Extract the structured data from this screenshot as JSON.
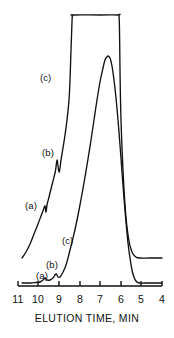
{
  "figure": {
    "title": "",
    "background_color": "#ffffff",
    "ink_color": "#111111",
    "width": 174,
    "height": 338
  },
  "axis": {
    "title": "ELUTION TIME, MIN",
    "tick_labels": [
      "11",
      "10",
      "9",
      "8",
      "7",
      "6",
      "5",
      "4"
    ],
    "tick_positions_px": [
      18,
      38,
      59,
      80,
      100,
      121,
      141,
      162
    ],
    "direction": "reversed",
    "x_pixel_start": 18,
    "x_pixel_end": 162,
    "baseline_y_px": 286
  },
  "curve_labels": [
    {
      "text": "(c)",
      "x": 40,
      "y": 73,
      "trace": "upper",
      "feature": "rising-edge"
    },
    {
      "text": "(b)",
      "x": 42,
      "y": 148,
      "trace": "upper",
      "feature": "minor-peak"
    },
    {
      "text": "(a)",
      "x": 25,
      "y": 201,
      "trace": "upper",
      "feature": "minor-peak"
    },
    {
      "text": "(c)",
      "x": 62,
      "y": 236,
      "trace": "lower",
      "feature": "rising-edge"
    },
    {
      "text": "(b)",
      "x": 46,
      "y": 260,
      "trace": "lower",
      "feature": "minor-peak"
    },
    {
      "text": "(a)",
      "x": 36,
      "y": 271,
      "trace": "lower",
      "feature": "minor-peak"
    }
  ],
  "chart_data": {
    "type": "line",
    "title": "",
    "subtitle": "",
    "xlabel": "ELUTION TIME, MIN",
    "ylabel": "",
    "xlim": [
      11,
      4
    ],
    "xticks": [
      11,
      10,
      9,
      8,
      7,
      6,
      5,
      4
    ],
    "grid": false,
    "legend": "inline-annotations",
    "annotations": [
      "(a)",
      "(b)",
      "(c)"
    ],
    "series": [
      {
        "name": "upper-trace",
        "description": "Offset upper chromatogram, saturated flat-topped main peak",
        "baseline_y_px": 258,
        "points_px": [
          [
            22,
            258
          ],
          [
            26,
            252
          ],
          [
            30,
            244
          ],
          [
            34,
            234
          ],
          [
            38,
            224
          ],
          [
            41,
            216
          ],
          [
            43,
            211
          ],
          [
            45,
            206
          ],
          [
            46,
            212
          ],
          [
            47,
            205
          ],
          [
            49,
            197
          ],
          [
            51,
            189
          ],
          [
            53,
            181
          ],
          [
            55,
            173
          ],
          [
            56,
            167
          ],
          [
            57,
            160
          ],
          [
            58,
            166
          ],
          [
            59,
            172
          ],
          [
            60,
            168
          ],
          [
            61,
            160
          ],
          [
            63,
            148
          ],
          [
            65,
            135
          ],
          [
            67,
            120
          ],
          [
            69,
            100
          ],
          [
            70,
            80
          ],
          [
            71,
            50
          ],
          [
            72,
            22
          ],
          [
            72.5,
            16
          ],
          [
            74,
            15
          ],
          [
            100,
            15
          ],
          [
            118,
            15
          ],
          [
            119,
            16
          ],
          [
            119.5,
            30
          ],
          [
            120,
            70
          ],
          [
            121,
            120
          ],
          [
            123,
            170
          ],
          [
            125,
            205
          ],
          [
            127,
            227
          ],
          [
            129,
            241
          ],
          [
            131,
            249
          ],
          [
            133,
            254
          ],
          [
            136,
            257
          ],
          [
            140,
            258
          ],
          [
            150,
            258
          ],
          [
            162,
            258
          ]
        ]
      },
      {
        "name": "lower-trace",
        "description": "Attenuated lower chromatogram with resolved (a), (b) and full (c) peak",
        "baseline_y_px": 283,
        "points_px": [
          [
            22,
            283
          ],
          [
            30,
            283
          ],
          [
            36,
            282.5
          ],
          [
            40,
            282
          ],
          [
            43,
            280
          ],
          [
            45,
            278
          ],
          [
            46,
            279
          ],
          [
            47,
            280
          ],
          [
            50,
            280
          ],
          [
            53,
            278
          ],
          [
            55,
            275
          ],
          [
            56,
            274
          ],
          [
            57,
            275
          ],
          [
            58,
            277
          ],
          [
            60,
            277
          ],
          [
            62,
            274
          ],
          [
            64,
            270
          ],
          [
            66,
            265
          ],
          [
            68,
            258
          ],
          [
            70,
            250
          ],
          [
            73,
            238
          ],
          [
            76,
            225
          ],
          [
            79,
            210
          ],
          [
            82,
            194
          ],
          [
            85,
            177
          ],
          [
            88,
            159
          ],
          [
            91,
            140
          ],
          [
            94,
            120
          ],
          [
            97,
            100
          ],
          [
            100,
            82
          ],
          [
            103,
            68
          ],
          [
            105,
            60
          ],
          [
            107,
            57
          ],
          [
            108,
            56
          ],
          [
            110,
            58
          ],
          [
            112,
            66
          ],
          [
            114,
            80
          ],
          [
            116,
            98
          ],
          [
            118,
            120
          ],
          [
            120,
            145
          ],
          [
            122,
            172
          ],
          [
            124,
            198
          ],
          [
            126,
            222
          ],
          [
            128,
            243
          ],
          [
            130,
            258
          ],
          [
            132,
            270
          ],
          [
            134,
            277
          ],
          [
            136,
            281
          ],
          [
            139,
            283
          ],
          [
            145,
            283
          ],
          [
            155,
            283
          ],
          [
            162,
            283
          ]
        ]
      }
    ]
  }
}
